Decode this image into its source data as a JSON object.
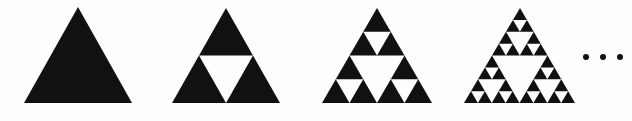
{
  "figure": {
    "name": "sierpinski-triangle-iterations",
    "caption": "",
    "background_color": "#fdfdfd",
    "fill_color": "#111111",
    "hole_color": "#fdfdfd",
    "width": 632,
    "height": 121
  },
  "ellipsis": {
    "label": "...",
    "dot_count": 3,
    "dot_color": "#111111",
    "x": 583,
    "y": 54
  },
  "chart_data": {
    "type": "diagram",
    "title": "Sierpinski Triangle Iterations",
    "xlabel": "",
    "ylabel": "",
    "categories": [
      "n = 0",
      "n = 1",
      "n = 2",
      "n = 3"
    ],
    "values": [
      1,
      3,
      9,
      27
    ],
    "series": [
      {
        "name": "black sub-triangles",
        "values": [
          1,
          3,
          9,
          27
        ]
      },
      {
        "name": "white holes",
        "values": [
          0,
          1,
          4,
          13
        ]
      }
    ],
    "annotations": [
      "..."
    ],
    "legend_position": "none",
    "grid": false
  },
  "stages": [
    {
      "name": "sierpinski-stage-0",
      "iteration": 0,
      "label": "n = 0",
      "apex_x": 78,
      "base_left_x": 24,
      "base_right_x": 132,
      "apex_y": 7,
      "base_y": 103,
      "black_triangles": 1,
      "white_holes": 0
    },
    {
      "name": "sierpinski-stage-1",
      "iteration": 1,
      "label": "n = 1",
      "apex_x": 226,
      "base_left_x": 172,
      "base_right_x": 280,
      "apex_y": 8,
      "base_y": 103,
      "black_triangles": 3,
      "white_holes": 1
    },
    {
      "name": "sierpinski-stage-2",
      "iteration": 2,
      "label": "n = 2",
      "apex_x": 377,
      "base_left_x": 322,
      "base_right_x": 432,
      "apex_y": 8,
      "base_y": 103,
      "black_triangles": 9,
      "white_holes": 4
    },
    {
      "name": "sierpinski-stage-3",
      "iteration": 3,
      "label": "n = 3",
      "apex_x": 520,
      "base_left_x": 464,
      "base_right_x": 575,
      "apex_y": 8,
      "base_y": 103,
      "black_triangles": 27,
      "white_holes": 13
    }
  ]
}
